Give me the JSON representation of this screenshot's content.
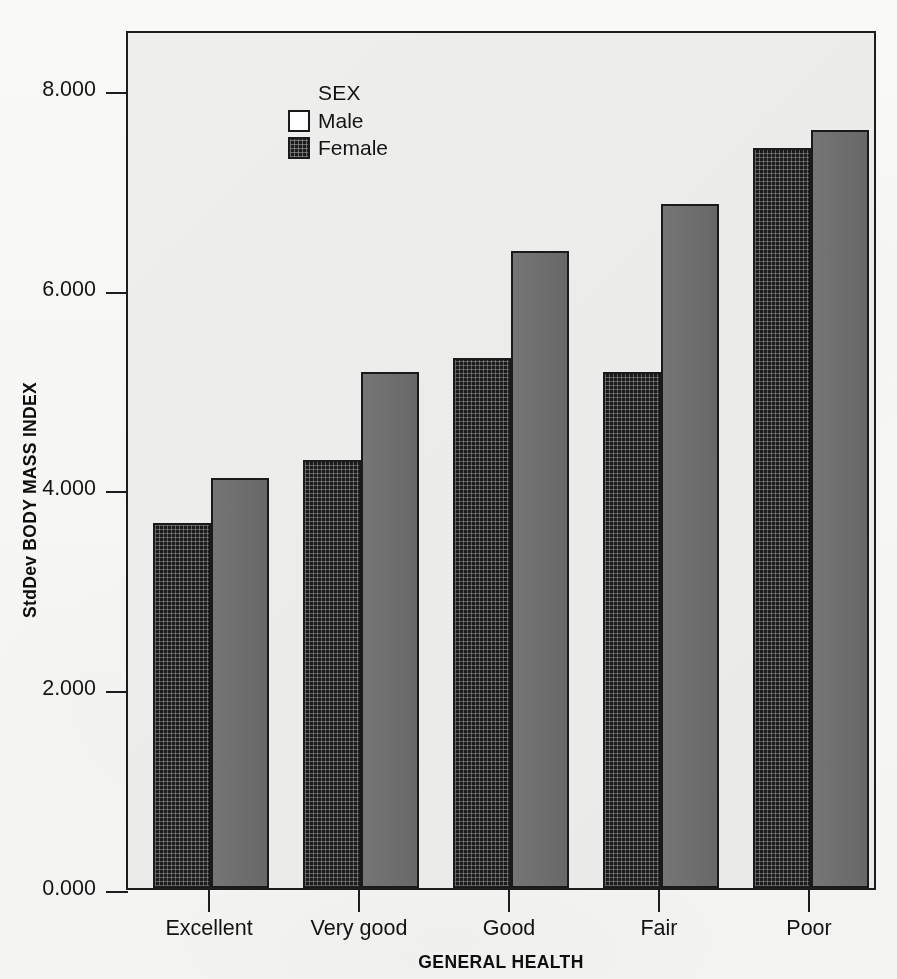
{
  "chart_data": {
    "type": "bar",
    "title": "",
    "xlabel": "GENERAL HEALTH",
    "ylabel": "StdDev BODY MASS INDEX",
    "categories": [
      "Excellent",
      "Very good",
      "Good",
      "Fair",
      "Poor"
    ],
    "series": [
      {
        "name": "Male",
        "values": [
          3.65,
          4.29,
          5.31,
          5.17,
          7.41
        ]
      },
      {
        "name": "Female",
        "values": [
          4.1,
          5.17,
          6.38,
          6.85,
          7.59
        ]
      }
    ],
    "ylim": [
      0,
      8.6
    ],
    "ytick_labels": [
      "8.000",
      "6.000",
      "4.000",
      "2.000",
      "0.000"
    ],
    "ytick_values": [
      8,
      6,
      4,
      2,
      0
    ],
    "grid": false,
    "legend_position": "top-left",
    "legend_title": "SEX"
  },
  "legend": {
    "title": "SEX",
    "entries": [
      {
        "label": "Male",
        "swatch": "empty-square-swatch"
      },
      {
        "label": "Female",
        "swatch": "crosshatch-square-swatch"
      }
    ]
  },
  "axes": {
    "y_title": "StdDev BODY MASS INDEX",
    "x_title": "GENERAL HEALTH"
  },
  "colors": {
    "male_bar": "#1b1b1b",
    "female_bar": "#6e6e6e",
    "frame": "#1d1d1d",
    "plot_background": "#f1f1ef",
    "text": "#131313"
  }
}
